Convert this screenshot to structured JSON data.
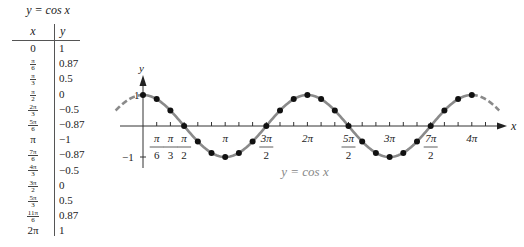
{
  "table": {
    "title": "y = cos x",
    "headers": [
      "x",
      "y"
    ],
    "rows": [
      {
        "x": "0",
        "y": "1"
      },
      {
        "x": "π/6",
        "y": "0.87"
      },
      {
        "x": "π/3",
        "y": "0.5"
      },
      {
        "x": "π/2",
        "y": "0"
      },
      {
        "x": "2π/3",
        "y": "−0.5"
      },
      {
        "x": "5π/6",
        "y": "−0.87"
      },
      {
        "x": "π",
        "y": "−1"
      },
      {
        "x": "7π/6",
        "y": "−0.87"
      },
      {
        "x": "4π/3",
        "y": "−0.5"
      },
      {
        "x": "3π/2",
        "y": "0"
      },
      {
        "x": "5π/3",
        "y": "0.5"
      },
      {
        "x": "11π/6",
        "y": "0.87"
      },
      {
        "x": "2π",
        "y": "1"
      }
    ]
  },
  "chart_data": {
    "type": "line",
    "title": "y = cos x",
    "xlabel": "x",
    "ylabel": "y",
    "x_tick_labels": [
      "π/6",
      "π/3",
      "π/2",
      "π",
      "3π/2",
      "2π",
      "5π/2",
      "3π",
      "7π/2",
      "4π"
    ],
    "y_tick_labels": [
      "1",
      "−1"
    ],
    "xlim": [
      "-π/3",
      "4π+π/3"
    ],
    "ylim": [
      -1,
      1
    ],
    "grid": false,
    "legend": null,
    "series": [
      {
        "name": "y = cos x (plotted points, every π/6 from 0 to 4π)",
        "x": [
          "0",
          "π/6",
          "π/3",
          "π/2",
          "2π/3",
          "5π/6",
          "π",
          "7π/6",
          "4π/3",
          "3π/2",
          "5π/3",
          "11π/6",
          "2π",
          "13π/6",
          "7π/3",
          "5π/2",
          "8π/3",
          "17π/6",
          "3π",
          "19π/6",
          "10π/3",
          "7π/2",
          "11π/3",
          "23π/6",
          "4π"
        ],
        "y": [
          1,
          0.87,
          0.5,
          0,
          -0.5,
          -0.87,
          -1,
          -0.87,
          -0.5,
          0,
          0.5,
          0.87,
          1,
          0.87,
          0.5,
          0,
          -0.5,
          -0.87,
          -1,
          -0.87,
          -0.5,
          0,
          0.5,
          0.87,
          1
        ]
      }
    ],
    "curve": {
      "style": "solid gray from 0 to 4π, dashed extensions beyond",
      "color": "#8a8a8a"
    },
    "point_color": "#000000"
  },
  "graph": {
    "x_axis_label": "x",
    "y_axis_label": "y",
    "y_tick_one": "1",
    "y_tick_neg_one": "−1",
    "caption": "y = cos x"
  }
}
